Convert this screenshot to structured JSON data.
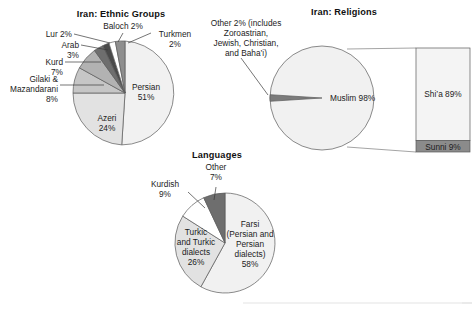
{
  "figure": {
    "background": "#ffffff",
    "stroke_color": "#5a5a5a",
    "text_color": "#1c1c1c"
  },
  "charts": [
    {
      "id": "ethnic-groups",
      "type": "pie",
      "title": "Iran: Ethnic Groups",
      "center": [
        125,
        93
      ],
      "radius": 52,
      "start_angle": -90,
      "categories": [
        "Persian",
        "Azeri",
        "Gilaki & Mazandarani",
        "Kurd",
        "Arab",
        "Lur",
        "Baloch",
        "Turkmen"
      ],
      "values": [
        51,
        24,
        8,
        7,
        3,
        2,
        2,
        2
      ],
      "colors": [
        "#f1f1f1",
        "#e2e2e2",
        "#c6c6c6",
        "#b2b2b2",
        "#6e6e6e",
        "#4a4a4a",
        "#ffffff",
        "#8e8e8e"
      ],
      "labels": [
        {
          "text_lines": [
            "Persian",
            "51%"
          ],
          "placement": "inside",
          "x": 146,
          "y": 90
        },
        {
          "text_lines": [
            "Azeri",
            "24%"
          ],
          "placement": "inside",
          "x": 107,
          "y": 121
        },
        {
          "text_lines": [
            "Gilaki &",
            "Mazandarani",
            "8%"
          ],
          "placement": "outside",
          "x": 58,
          "y": 88,
          "anchor": "end"
        },
        {
          "text_lines": [
            "Kurd",
            "7%"
          ],
          "placement": "outside",
          "x": 62,
          "y": 66,
          "anchor": "end"
        },
        {
          "text_lines": [
            "Arab",
            "3%"
          ],
          "placement": "outside",
          "x": 79,
          "y": 48,
          "anchor": "end"
        },
        {
          "text_lines": [
            "Lur 2%"
          ],
          "placement": "outside",
          "x": 72,
          "y": 37,
          "anchor": "end"
        },
        {
          "text_lines": [
            "Baloch 2%"
          ],
          "placement": "outside",
          "x": 123,
          "y": 29,
          "anchor": "middle"
        },
        {
          "text_lines": [
            "Turkmen",
            "2%"
          ],
          "placement": "outside",
          "x": 173,
          "y": 37,
          "anchor": "middle"
        }
      ]
    },
    {
      "id": "religions",
      "type": "pie",
      "title": "Iran: Religions",
      "center": [
        322,
        98
      ],
      "radius": 52,
      "categories": [
        "Muslim",
        "Other"
      ],
      "values": [
        98,
        2
      ],
      "colors": [
        "#f1f1f1",
        "#7b7b7b"
      ],
      "labels": [
        {
          "text_lines": [
            "Muslim 98%"
          ],
          "placement": "inside",
          "x": 330,
          "y": 100
        },
        {
          "text_lines": [
            "Other 2% (includes",
            "Zoroastrian,",
            "Jewish, Christian,",
            "and Baha’i)"
          ],
          "placement": "outside",
          "x": 246,
          "y": 29,
          "anchor": "middle"
        }
      ],
      "breakout": {
        "type": "bar",
        "x": 416,
        "y": 48,
        "width": 54,
        "height": 104,
        "segments": [
          {
            "label": "Shi’a 89%",
            "value": 89,
            "color": "#f4f4f4",
            "text_color": "#1c1c1c"
          },
          {
            "label": "Sunni 9%",
            "value": 9,
            "color": "#8b8b8b",
            "text_color": "#1c1c1c"
          }
        ]
      }
    },
    {
      "id": "languages",
      "type": "pie",
      "title": "Languages",
      "center": [
        225,
        243
      ],
      "radius": 50,
      "start_angle": -90,
      "categories": [
        "Farsi (Persian and Persian dialects)",
        "Turkic and Turkic dialects",
        "Kurdish",
        "Other"
      ],
      "values": [
        58,
        26,
        9,
        7
      ],
      "colors": [
        "#f1f1f1",
        "#e2e2e2",
        "#ffffff",
        "#6e6e6e"
      ],
      "labels": [
        {
          "text_lines": [
            "Farsi",
            "(Persian and",
            "Persian",
            "dialects)",
            "58%"
          ],
          "placement": "inside",
          "x": 248,
          "y": 229
        },
        {
          "text_lines": [
            "Turkic",
            "and Turkic",
            "dialects",
            "26%"
          ],
          "placement": "inside",
          "x": 198,
          "y": 238
        },
        {
          "text_lines": [
            "Kurdish",
            "9%"
          ],
          "placement": "outside",
          "x": 176,
          "y": 189,
          "anchor": "middle"
        },
        {
          "text_lines": [
            "Other",
            "7%"
          ],
          "placement": "outside",
          "x": 216,
          "y": 167,
          "anchor": "middle"
        }
      ]
    }
  ]
}
